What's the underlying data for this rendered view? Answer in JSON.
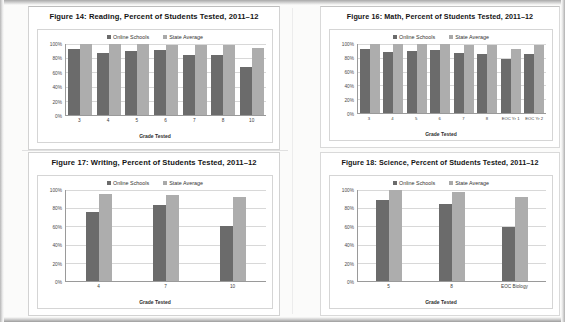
{
  "document": {
    "type": "scanned-report-page",
    "figure_count": 4
  },
  "legend": {
    "online_label": "Online Schools",
    "state_label": "State Average",
    "online_color": "#6b6b6b",
    "state_color": "#adadad"
  },
  "axis": {
    "y_ticks": [
      "100%",
      "80%",
      "60%",
      "40%",
      "20%",
      "0%"
    ],
    "x_title": "Grade Tested"
  },
  "figures": [
    {
      "id": "fig14",
      "title": "Figure 14: Reading, Percent of Students Tested, 2011–12"
    },
    {
      "id": "fig16",
      "title": "Figure 16: Math, Percent of Students Tested, 2011–12"
    },
    {
      "id": "fig17",
      "title": "Figure 17: Writing, Percent of Students Tested, 2011–12"
    },
    {
      "id": "fig18",
      "title": "Figure 18: Science, Percent of Students Tested, 2011–12"
    }
  ],
  "chart_data": [
    {
      "type": "bar",
      "id": "fig14",
      "title": "Figure 14: Reading, Percent of Students Tested, 2011–12",
      "xlabel": "Grade Tested",
      "ylabel": "",
      "ylim": [
        0,
        100
      ],
      "yticks": [
        0,
        20,
        40,
        60,
        80,
        100
      ],
      "ytick_labels": [
        "0%",
        "20%",
        "40%",
        "60%",
        "80%",
        "100%"
      ],
      "grid": true,
      "legend_position": "top-center",
      "categories": [
        "3",
        "4",
        "5",
        "6",
        "7",
        "8",
        "10"
      ],
      "series": [
        {
          "name": "Online Schools",
          "values": [
            93,
            88,
            90,
            91,
            85,
            85,
            67
          ]
        },
        {
          "name": "State Average",
          "values": [
            100,
            100,
            100,
            99,
            98,
            98,
            95
          ]
        }
      ]
    },
    {
      "type": "bar",
      "id": "fig16",
      "title": "Figure 16: Math, Percent of Students Tested, 2011–12",
      "xlabel": "Grade Tested",
      "ylabel": "",
      "ylim": [
        0,
        100
      ],
      "yticks": [
        0,
        20,
        40,
        60,
        80,
        100
      ],
      "ytick_labels": [
        "0%",
        "20%",
        "40%",
        "60%",
        "80%",
        "100%"
      ],
      "grid": true,
      "legend_position": "top-center",
      "categories": [
        "3",
        "4",
        "5",
        "6",
        "7",
        "8",
        "EOC Yr 1",
        "EOC Yr 2"
      ],
      "series": [
        {
          "name": "Online Schools",
          "values": [
            93,
            89,
            90,
            91,
            87,
            86,
            78,
            85
          ]
        },
        {
          "name": "State Average",
          "values": [
            100,
            100,
            100,
            100,
            99,
            99,
            93,
            99
          ]
        }
      ]
    },
    {
      "type": "bar",
      "id": "fig17",
      "title": "Figure 17: Writing, Percent of Students Tested, 2011–12",
      "xlabel": "Grade Tested",
      "ylabel": "",
      "ylim": [
        0,
        100
      ],
      "yticks": [
        0,
        20,
        40,
        60,
        80,
        100
      ],
      "ytick_labels": [
        "0%",
        "20%",
        "40%",
        "60%",
        "80%",
        "100%"
      ],
      "grid": true,
      "legend_position": "top-center",
      "categories": [
        "4",
        "7",
        "10"
      ],
      "series": [
        {
          "name": "Online Schools",
          "values": [
            76,
            83,
            61
          ]
        },
        {
          "name": "State Average",
          "values": [
            96,
            95,
            92
          ]
        }
      ]
    },
    {
      "type": "bar",
      "id": "fig18",
      "title": "Figure 18: Science, Percent of Students Tested, 2011–12",
      "xlabel": "Grade Tested",
      "ylabel": "",
      "ylim": [
        0,
        100
      ],
      "yticks": [
        0,
        20,
        40,
        60,
        80,
        100
      ],
      "ytick_labels": [
        "0%",
        "20%",
        "40%",
        "60%",
        "80%",
        "100%"
      ],
      "grid": true,
      "legend_position": "top-center",
      "categories": [
        "5",
        "8",
        "EOC Biology"
      ],
      "series": [
        {
          "name": "Online Schools",
          "values": [
            89,
            85,
            59
          ]
        },
        {
          "name": "State Average",
          "values": [
            100,
            98,
            92
          ]
        }
      ]
    }
  ]
}
